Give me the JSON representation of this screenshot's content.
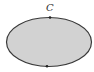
{
  "diagram": {
    "shape": "ellipse",
    "label": "C",
    "fill_color": "#d2d2d2",
    "stroke_color": "#3a3a3a",
    "points": [
      {
        "name": "top-point",
        "x": 50,
        "y": 18
      },
      {
        "name": "bottom-point",
        "x": 47,
        "y": 66
      }
    ]
  }
}
